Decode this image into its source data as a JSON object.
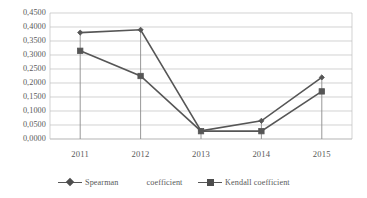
{
  "chart_data": {
    "type": "line",
    "title": "",
    "xlabel": "",
    "ylabel": "",
    "categories": [
      "2011",
      "2012",
      "2013",
      "2014",
      "2015"
    ],
    "series": [
      {
        "name": "Spearman coefficient",
        "legend_label_part1": "Spearman",
        "legend_label_part2": "coefficient",
        "marker": "diamond",
        "color": "#565656",
        "values": [
          0.38,
          0.39,
          0.029,
          0.065,
          0.22
        ]
      },
      {
        "name": "Kendall coefficient",
        "legend_label_part1": "Kendall coefficient",
        "legend_label_part2": "",
        "marker": "square",
        "color": "#565656",
        "values": [
          0.315,
          0.225,
          0.028,
          0.028,
          0.17
        ]
      }
    ],
    "ylim": [
      0.0,
      0.45
    ],
    "ytick_values": [
      0.0,
      0.05,
      0.1,
      0.15,
      0.2,
      0.25,
      0.3,
      0.35,
      0.4,
      0.45
    ],
    "ytick_labels": [
      "0,0000",
      "0,0500",
      "0,1000",
      "0,1500",
      "0,2000",
      "0,2500",
      "0,3000",
      "0,3500",
      "0,4000",
      "0,4500"
    ],
    "grid": {
      "horizontal": true,
      "vertical": false,
      "color": "#bfbfbf"
    },
    "drop_lines": true,
    "legend": {
      "position": "bottom",
      "entries": [
        "Spearman    coefficient",
        "Kendall coefficient"
      ]
    },
    "plot_area": {
      "left": 50,
      "right": 352,
      "top": 13,
      "bottom": 139
    }
  }
}
